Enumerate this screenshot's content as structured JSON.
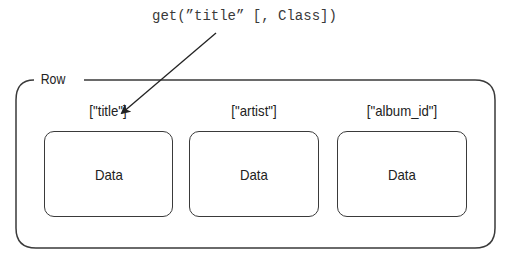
{
  "diagram": {
    "method_call": "get(”title” [, Class])",
    "container": {
      "label": "Row",
      "stroke_color": "#3a3a3a"
    },
    "columns": [
      {
        "key": "[\"title\"]",
        "value": "Data"
      },
      {
        "key": "[\"artist\"]",
        "value": "Data"
      },
      {
        "key": "[\"album_id\"]",
        "value": "Data"
      }
    ],
    "arrow": {
      "from": "method_call",
      "to": "columns.0.key"
    }
  }
}
